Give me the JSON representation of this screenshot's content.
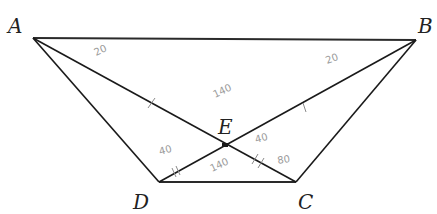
{
  "figure": {
    "type": "geometry-diagram",
    "shape": "trapezoid",
    "vertices": [
      {
        "id": "A",
        "label": "A"
      },
      {
        "id": "B",
        "label": "B"
      },
      {
        "id": "C",
        "label": "C"
      },
      {
        "id": "D",
        "label": "D"
      },
      {
        "id": "E",
        "label": "E"
      }
    ],
    "segments": [
      {
        "from": "A",
        "to": "B"
      },
      {
        "from": "A",
        "to": "D"
      },
      {
        "from": "D",
        "to": "C"
      },
      {
        "from": "C",
        "to": "B"
      },
      {
        "from": "A",
        "to": "C"
      },
      {
        "from": "B",
        "to": "D"
      }
    ],
    "intersection": {
      "point": "E",
      "of": [
        "AC",
        "BD"
      ]
    },
    "annotations": {
      "angle_A": "20",
      "angle_B": "20",
      "angle_AEB": "140",
      "angle_AED": "40",
      "angle_BEC": "40",
      "angle_DEC": "140",
      "angle_C": "80"
    },
    "colors": {
      "lines": "#1a1a1a",
      "annotations": "#9a9a9a"
    }
  }
}
